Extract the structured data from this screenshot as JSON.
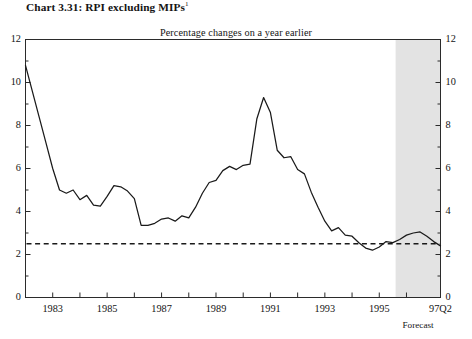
{
  "chart": {
    "title_prefix": "Chart 3.31: RPI excluding MIPs",
    "title_superscript": "1",
    "subtitle": "Percentage changes on a year earlier",
    "forecast_label": "Forecast",
    "series_color": "#1a1a1a",
    "target_line_color": "#1a1a1a",
    "forecast_shade_color": "#e3e3e3",
    "axis_color": "#2b2b2b"
  },
  "chart_data": {
    "type": "line",
    "title": "Chart 3.31: RPI excluding MIPs",
    "subtitle": "Percentage changes on a year earlier",
    "xlabel": "",
    "ylabel": "",
    "ylim": [
      0,
      12
    ],
    "xlim": [
      1982.0,
      1997.25
    ],
    "grid": false,
    "legend": false,
    "y_ticks": [
      0,
      2,
      4,
      6,
      8,
      10,
      12
    ],
    "y_minor_ticks": [
      1,
      3,
      5,
      7,
      9,
      11
    ],
    "y_tick_labels": [
      "0",
      "2",
      "4",
      "6",
      "8",
      "10",
      "12"
    ],
    "x_tick_labels": [
      "1983",
      "1985",
      "1987",
      "1989",
      "1991",
      "1993",
      "1995",
      "97Q2"
    ],
    "x_tick_values": [
      1983,
      1985,
      1987,
      1989,
      1991,
      1993,
      1995,
      1997.25
    ],
    "x_minor_tick_values": [
      1982,
      1984,
      1986,
      1988,
      1990,
      1992,
      1994,
      1996
    ],
    "annotations": [
      {
        "name": "target-line",
        "type": "hline",
        "value": 2.5,
        "style": "dashed"
      },
      {
        "name": "forecast-region",
        "type": "vspan",
        "start": 1995.6,
        "end": 1997.25,
        "label": "Forecast"
      }
    ],
    "series": [
      {
        "name": "RPI excluding MIPs",
        "x": [
          1982.0,
          1982.25,
          1982.5,
          1982.75,
          1983.0,
          1983.25,
          1983.5,
          1983.75,
          1984.0,
          1984.25,
          1984.5,
          1984.75,
          1985.0,
          1985.25,
          1985.5,
          1985.75,
          1986.0,
          1986.25,
          1986.5,
          1986.75,
          1987.0,
          1987.25,
          1987.5,
          1987.75,
          1988.0,
          1988.25,
          1988.5,
          1988.75,
          1989.0,
          1989.25,
          1989.5,
          1989.75,
          1990.0,
          1990.25,
          1990.5,
          1990.75,
          1991.0,
          1991.25,
          1991.5,
          1991.75,
          1992.0,
          1992.25,
          1992.5,
          1992.75,
          1993.0,
          1993.25,
          1993.5,
          1993.75,
          1994.0,
          1994.25,
          1994.5,
          1994.75,
          1995.0,
          1995.25,
          1995.5,
          1995.75,
          1996.0,
          1996.25,
          1996.5,
          1996.75,
          1997.0,
          1997.25
        ],
        "values": [
          10.8,
          9.6,
          8.4,
          7.2,
          6.0,
          5.0,
          4.85,
          5.0,
          4.55,
          4.75,
          4.3,
          4.25,
          4.7,
          5.2,
          5.15,
          4.95,
          4.6,
          3.35,
          3.35,
          3.45,
          3.65,
          3.7,
          3.55,
          3.8,
          3.7,
          4.2,
          4.85,
          5.35,
          5.45,
          5.9,
          6.1,
          5.95,
          6.15,
          6.2,
          8.3,
          9.3,
          8.6,
          6.85,
          6.5,
          6.55,
          5.95,
          5.75,
          4.9,
          4.2,
          3.55,
          3.1,
          3.25,
          2.9,
          2.85,
          2.55,
          2.3,
          2.2,
          2.35,
          2.6,
          2.55,
          2.7,
          2.9,
          3.0,
          3.05,
          2.85,
          2.6,
          2.4
        ]
      }
    ],
    "target_line_value": 2.5
  }
}
